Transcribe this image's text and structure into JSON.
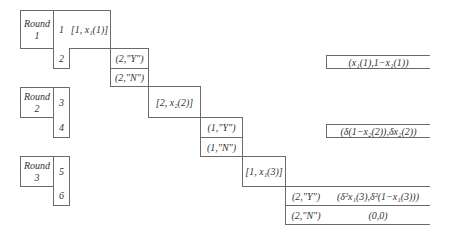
{
  "diagram": {
    "rounds": [
      {
        "label": "Round 1",
        "label_line1": "Round",
        "label_line2": "1",
        "steps": [
          "1",
          "2"
        ],
        "offer": "[1, x₁(1)]",
        "responses": [
          "(2,\"Y\")",
          "(2,\"N\")"
        ],
        "payoff_on_accept": "(x₁(1),1−x₁(1))"
      },
      {
        "label": "Round 2",
        "label_line1": "Round",
        "label_line2": "2",
        "steps": [
          "3",
          "4"
        ],
        "offer": "[2, x₂(2)]",
        "responses": [
          "(1,\"Y\")",
          "(1,\"N\")"
        ],
        "payoff_on_accept": "(δ(1−x₂(2)),δx₂(2))"
      },
      {
        "label": "Round 3",
        "label_line1": "Round",
        "label_line2": "3",
        "steps": [
          "5",
          "6"
        ],
        "offer": "[1, x₁(3)]",
        "responses": [
          "(2,\"Y\")",
          "(2,\"N\")"
        ],
        "payoff_on_accept": "(δ²x₁(3),δ²(1−x₁(3)))",
        "payoff_on_reject": "(0,0)"
      }
    ]
  }
}
